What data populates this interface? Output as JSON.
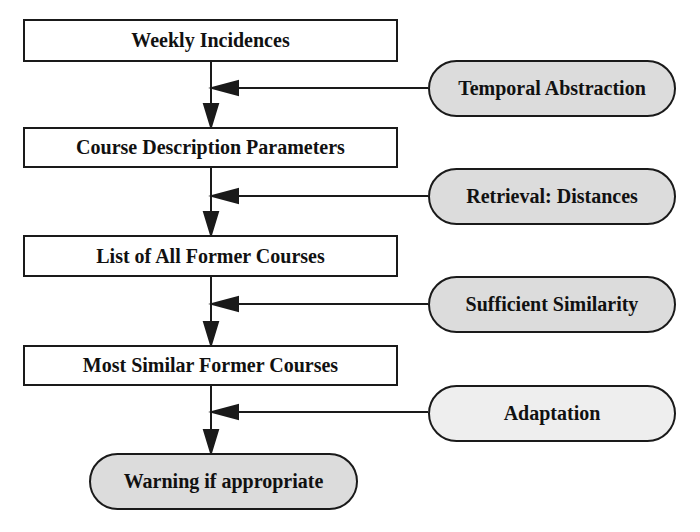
{
  "diagram": {
    "type": "flowchart",
    "colors": {
      "stroke": "#1a1a1a",
      "box_fill": "#ffffff",
      "pill_fill": "#dcdcdc",
      "pill_fill_light": "#eeeeee",
      "text": "#111111"
    },
    "main_steps": [
      {
        "label": "Weekly Incidences"
      },
      {
        "label": "Course Description Parameters"
      },
      {
        "label": "List of All Former Courses"
      },
      {
        "label": "Most Similar Former Courses"
      }
    ],
    "processes": [
      {
        "label": "Temporal Abstraction"
      },
      {
        "label": "Retrieval: Distances"
      },
      {
        "label": "Sufficient Similarity"
      },
      {
        "label": "Adaptation"
      }
    ],
    "output": {
      "label": "Warning if appropriate"
    }
  }
}
